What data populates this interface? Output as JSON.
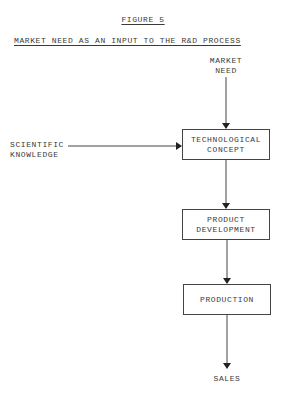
{
  "figure": {
    "label": "FIGURE 5",
    "title": "MARKET NEED AS AN INPUT TO THE R&D PROCESS"
  },
  "inputs": {
    "market_need_line1": "MARKET",
    "market_need_line2": "NEED",
    "scientific_line1": "SCIENTIFIC",
    "scientific_line2": "KNOWLEDGE"
  },
  "boxes": [
    {
      "line1": "TECHNOLOGICAL",
      "line2": "CONCEPT"
    },
    {
      "line1": "PRODUCT",
      "line2": "DEVELOPMENT"
    },
    {
      "line1": "PRODUCTION",
      "line2": ""
    }
  ],
  "output": {
    "label": "SALES"
  },
  "colors": {
    "ink": "#3a3a3a",
    "background": "#ffffff"
  }
}
